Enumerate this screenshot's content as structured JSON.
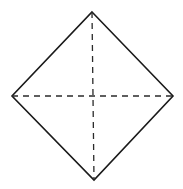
{
  "diagram": {
    "kind": "folded-square-diamond",
    "background": "#ffffff",
    "stroke_color": "#1a1a1a",
    "dash_color": "#2a2a2a",
    "vertices": {
      "top": [
        92,
        12
      ],
      "right": [
        173,
        96
      ],
      "bottom": [
        94,
        180
      ],
      "left": [
        12,
        96
      ]
    },
    "outline_edges": [
      "top-right",
      "right-bottom",
      "bottom-left",
      "left-top"
    ],
    "dashed_lines": [
      {
        "name": "vertical-diagonal",
        "from": "top",
        "to": "bottom"
      },
      {
        "name": "horizontal-diagonal",
        "from": "left",
        "to": "right"
      }
    ]
  }
}
